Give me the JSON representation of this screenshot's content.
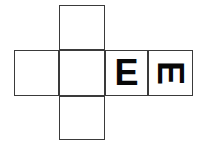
{
  "figure": {
    "kind": "cube-net-diagram",
    "background_color": "#ffffff",
    "line_color": "#3a3a3a",
    "glyph_color": "#080808",
    "canvas": {
      "width": 203,
      "height": 151
    }
  },
  "net": {
    "vertical_column": {
      "x": 59,
      "width": 46,
      "cells": [
        {
          "id": "top-face",
          "name": "cell-top",
          "y": 5,
          "height": 45,
          "letter": ""
        },
        {
          "id": "center-face",
          "name": "cell-center",
          "y": 50,
          "height": 46,
          "letter": ""
        },
        {
          "id": "bottom-face",
          "name": "cell-bottom",
          "y": 96,
          "height": 44,
          "letter": ""
        }
      ]
    },
    "horizontal_row": {
      "y": 50,
      "height": 46,
      "cells": [
        {
          "id": "row-face-1",
          "name": "cell-row-1",
          "x": 14,
          "width": 45,
          "letter": "",
          "rotation": 0
        },
        {
          "id": "row-face-2",
          "name": "cell-row-2",
          "x": 59,
          "width": 46,
          "letter": "",
          "rotation": 0
        },
        {
          "id": "row-face-3",
          "name": "cell-row-3",
          "x": 105,
          "width": 43,
          "letter": "E",
          "rotation": 0
        },
        {
          "id": "row-face-4",
          "name": "cell-row-4",
          "x": 148,
          "width": 45,
          "letter": "E",
          "rotation": 90
        }
      ]
    }
  },
  "labels": {
    "upright_letter": "E",
    "rotated_letter": "E",
    "rotated_letter_rotation_degrees": "90"
  }
}
